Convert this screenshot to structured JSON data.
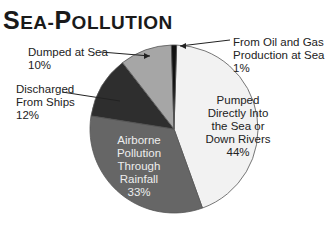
{
  "title": {
    "first_cap": "S",
    "first_rest": "EA",
    "dash": "-",
    "second_cap": "P",
    "second_rest": "OLLUTION",
    "full": "Sea-Pollution"
  },
  "chart_data": {
    "type": "pie",
    "title": "Sea-Pollution",
    "categories": [
      "Pumped Directly Into the Sea or Down Rivers",
      "Airborne Pollution Through Rainfall",
      "Discharged From Ships",
      "Dumped at Sea",
      "From Oil and Gas Production at Sea"
    ],
    "values": [
      44,
      33,
      12,
      10,
      1
    ],
    "unit": "%",
    "colors": [
      "#f2f2f2",
      "#666666",
      "#2e2e2e",
      "#a6a6a6",
      "#111111"
    ],
    "legend": "none (labels on/around slices)"
  },
  "labels": {
    "pumped": {
      "line1": "Pumped",
      "line2": "Directly Into",
      "line3": "the Sea or",
      "line4": "Down Rivers",
      "pct": "44%"
    },
    "airborne": {
      "line1": "Airborne",
      "line2": "Pollution",
      "line3": "Through",
      "line4": "Rainfall",
      "pct": "33%"
    },
    "ships": {
      "line1": "Discharged",
      "line2": "From Ships",
      "pct": "12%"
    },
    "dumped": {
      "line1": "Dumped at Sea",
      "pct": "10%"
    },
    "oil": {
      "line1": "From Oil and Gas",
      "line2": "Production at Sea",
      "pct": "1%"
    }
  }
}
